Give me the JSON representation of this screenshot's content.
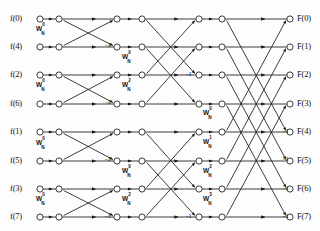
{
  "figure": {
    "kind": "fft-butterfly-signal-flow-graph",
    "size": 8,
    "stages": 3,
    "line_color": "#1a1a1a",
    "node_fill": "#ffffff",
    "background": "#fdfdfd"
  },
  "inputs": [
    {
      "label": "f(0)",
      "row": 0
    },
    {
      "label": "f(4)",
      "row": 1
    },
    {
      "label": "f(2)",
      "row": 2
    },
    {
      "label": "f(6)",
      "row": 3
    },
    {
      "label": "f(1)",
      "row": 4
    },
    {
      "label": "f(5)",
      "row": 5
    },
    {
      "label": "f(3)",
      "row": 6
    },
    {
      "label": "f(7)",
      "row": 7
    }
  ],
  "outputs": [
    {
      "label": "F(0)",
      "row": 0
    },
    {
      "label": "F(1)",
      "row": 1
    },
    {
      "label": "F(2)",
      "row": 2
    },
    {
      "label": "F(3)",
      "row": 3
    },
    {
      "label": "F(4)",
      "row": 4
    },
    {
      "label": "F(5)",
      "row": 5
    },
    {
      "label": "F(6)",
      "row": 6
    },
    {
      "label": "F(7)",
      "row": 7
    }
  ],
  "twiddles": [
    {
      "base": "W",
      "sub": "N",
      "sup": "0",
      "stage": 1,
      "row": 1,
      "x": 36,
      "y": 24
    },
    {
      "base": "W",
      "sub": "N",
      "sup": "0",
      "stage": 1,
      "row": 3,
      "x": 36,
      "y": 80
    },
    {
      "base": "W",
      "sub": "N",
      "sup": "0",
      "stage": 1,
      "row": 5,
      "x": 36,
      "y": 138
    },
    {
      "base": "W",
      "sub": "N",
      "sup": "0",
      "stage": 1,
      "row": 7,
      "x": 36,
      "y": 194
    },
    {
      "base": "W",
      "sub": "N",
      "sup": "0",
      "stage": 2,
      "row": 2,
      "x": 122,
      "y": 52
    },
    {
      "base": "W",
      "sub": "N",
      "sup": "2",
      "stage": 2,
      "row": 3,
      "x": 122,
      "y": 80
    },
    {
      "base": "W",
      "sub": "N",
      "sup": "0",
      "stage": 2,
      "row": 6,
      "x": 122,
      "y": 166
    },
    {
      "base": "W",
      "sub": "N",
      "sup": "2",
      "stage": 2,
      "row": 7,
      "x": 122,
      "y": 194
    },
    {
      "base": "W",
      "sub": "N",
      "sup": "0",
      "stage": 3,
      "row": 4,
      "x": 203,
      "y": 108
    },
    {
      "base": "W",
      "sub": "N",
      "sup": "1",
      "stage": 3,
      "row": 5,
      "x": 203,
      "y": 137
    },
    {
      "base": "W",
      "sub": "N",
      "sup": "2",
      "stage": 3,
      "row": 6,
      "x": 203,
      "y": 166
    },
    {
      "base": "W",
      "sub": "N",
      "sup": "3",
      "stage": 3,
      "row": 7,
      "x": 203,
      "y": 194
    }
  ],
  "minus_ones": [
    {
      "value": "-1",
      "stage": 1,
      "row": 1,
      "x": 105,
      "y": 41
    },
    {
      "value": "-1",
      "stage": 1,
      "row": 3,
      "x": 105,
      "y": 98
    },
    {
      "value": "-1",
      "stage": 1,
      "row": 5,
      "x": 105,
      "y": 155
    },
    {
      "value": "-1",
      "stage": 1,
      "row": 7,
      "x": 105,
      "y": 212
    },
    {
      "value": "-1",
      "stage": 2,
      "row": 2,
      "x": 186,
      "y": 70
    },
    {
      "value": "-1",
      "stage": 2,
      "row": 3,
      "x": 186,
      "y": 212
    },
    {
      "value": "-1",
      "stage": 3,
      "row": 4,
      "x": 283,
      "y": 127
    },
    {
      "value": "-1",
      "stage": 3,
      "row": 5,
      "x": 283,
      "y": 155
    },
    {
      "value": "-1",
      "stage": 3,
      "row": 6,
      "x": 283,
      "y": 184
    },
    {
      "value": "-1",
      "stage": 3,
      "row": 7,
      "x": 283,
      "y": 212
    }
  ],
  "geometry": {
    "row_y": [
      19,
      47,
      75,
      104,
      132,
      161,
      189,
      217
    ],
    "col_x": [
      40,
      59,
      117,
      142,
      199,
      222,
      290
    ],
    "node_radius": 3.1
  },
  "chart_data": {
    "type": "diagram",
    "title": "",
    "stage_butterfly_span": [
      1,
      2,
      4
    ],
    "stage1_pairs": [
      [
        0,
        1
      ],
      [
        2,
        3
      ],
      [
        4,
        5
      ],
      [
        6,
        7
      ]
    ],
    "stage2_pairs": [
      [
        0,
        2
      ],
      [
        1,
        3
      ],
      [
        4,
        6
      ],
      [
        5,
        7
      ]
    ],
    "stage3_pairs": [
      [
        0,
        4
      ],
      [
        1,
        5
      ],
      [
        2,
        6
      ],
      [
        3,
        7
      ]
    ]
  }
}
